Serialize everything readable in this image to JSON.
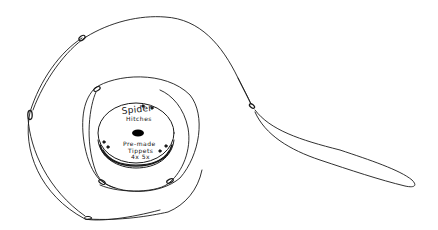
{
  "drawing": {
    "subject": "tippet spool with looped line",
    "stroke_color": "#1a1a1a",
    "background": "#ffffff",
    "spool_label": {
      "line1": "Spider",
      "line2": "Hitches",
      "line3": "Pre-made",
      "line4": "Tippets",
      "line5": "4x 5x"
    }
  }
}
